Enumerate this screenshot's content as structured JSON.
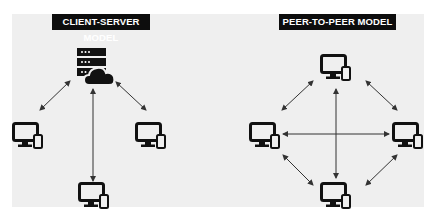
{
  "left_model": {
    "title": "CLIENT-SERVER MODEL",
    "server": {
      "icon": "server-cloud-icon",
      "x": 188,
      "y": 48
    },
    "clients": [
      {
        "icon": "desktop-phone-icon",
        "x": 12,
        "y": 122
      },
      {
        "icon": "desktop-phone-icon",
        "x": 135,
        "y": 122
      },
      {
        "icon": "desktop-phone-icon",
        "x": 78,
        "y": 186
      }
    ],
    "connections": "bidirectional arrows from server to each client"
  },
  "right_model": {
    "title": "PEER-TO-PEER MODEL",
    "peers": [
      {
        "position": "top",
        "icon": "desktop-phone-icon"
      },
      {
        "position": "left",
        "icon": "desktop-phone-icon"
      },
      {
        "position": "right",
        "icon": "desktop-phone-icon"
      },
      {
        "position": "bottom",
        "icon": "desktop-phone-icon"
      }
    ],
    "connections": "bidirectional arrows between every pair of peers"
  },
  "colors": {
    "background": "#efefef",
    "title_bg": "#0d0d0d",
    "title_text": "#ffffff",
    "icon": "#111111",
    "arrow": "#333333"
  }
}
